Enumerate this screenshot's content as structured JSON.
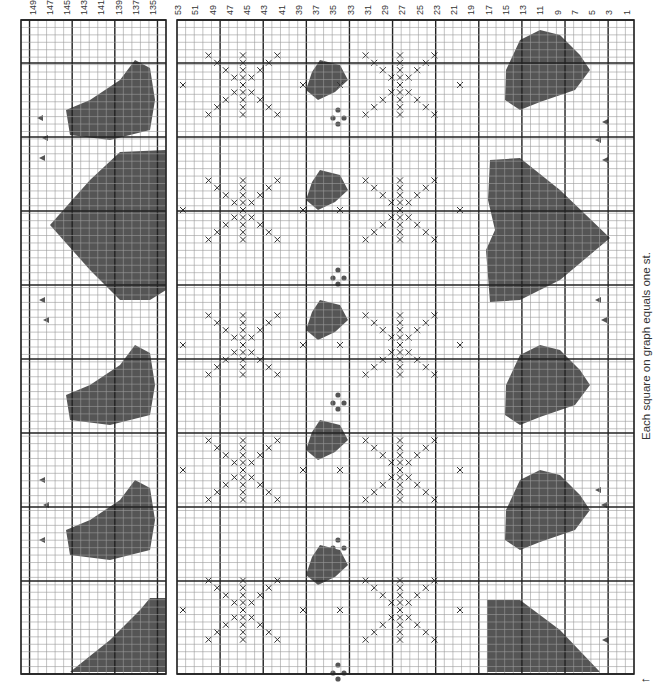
{
  "chart": {
    "caption": "Each square on graph equals one st.",
    "start_arrow": "←",
    "colors": {
      "fill": "#555555",
      "grid_thin": "#9a9a9a",
      "grid_thick": "#222222",
      "x_mark": "#333333"
    },
    "main_panel": {
      "column_labels": [
        "53",
        "51",
        "49",
        "47",
        "45",
        "43",
        "41",
        "39",
        "37",
        "35",
        "33",
        "31",
        "29",
        "27",
        "25",
        "23",
        "21",
        "19",
        "17",
        "15",
        "13",
        "11",
        "9",
        "7",
        "5",
        "3",
        "1"
      ],
      "stitches_from": 53,
      "stitches_to": 1
    },
    "left_panel": {
      "column_labels": [
        "149",
        "147",
        "145",
        "143",
        "141",
        "139",
        "137",
        "135"
      ],
      "stitches_from": 150,
      "stitches_to": 134
    },
    "motifs": [
      "teddy bear",
      "heart",
      "snowflake (cross-stitch X)",
      "small bear",
      "bobble (dots)",
      "triangle marker"
    ]
  }
}
